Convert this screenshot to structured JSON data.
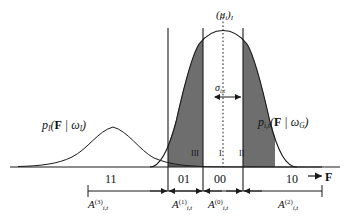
{
  "figure": {
    "axis": {
      "x_label": "F",
      "x_arrow": "→"
    },
    "curves": [
      {
        "name": "image-likelihood-curve",
        "label_html": "p_I(F | ω_I)",
        "label_main": "p",
        "label_sub": "I",
        "label_args_bf": "F",
        "label_bar": "|",
        "label_omega": "ω",
        "label_omega_sub": "I",
        "mean_x": 113,
        "peak_y": 118,
        "sigma": 45,
        "kind": "wide-gaussian"
      },
      {
        "name": "gaussian-mixture-curve",
        "label_main": "p",
        "label_sub": "i,t",
        "label_args_bf": "F",
        "label_bar": "|",
        "label_omega": "ω",
        "label_omega_sub": "G",
        "mean_x": 223,
        "peak_y": 40,
        "sigma": 17,
        "kind": "narrow-gaussian"
      }
    ],
    "mean_marker": {
      "name": "mean-dotted-line",
      "label_open": "(",
      "label_mu": "μ",
      "label_mu_sub": "i",
      "label_close": ")",
      "label_outer_sub": "I",
      "x": 223
    },
    "sigma_marker": {
      "name": "sigma-width-arrow",
      "label_sigma": "σ",
      "label_sub": "i,t",
      "left_x": 213,
      "right_x": 243,
      "y": 97
    },
    "vertical_lines": [
      {
        "name": "threshold-line-1",
        "x": 168
      },
      {
        "name": "threshold-line-2",
        "x": 203
      },
      {
        "name": "threshold-line-3",
        "x": 243
      }
    ],
    "regions": [
      {
        "name": "region-III",
        "label": "III",
        "shade": "dark"
      },
      {
        "name": "region-I",
        "label": "I",
        "shade": "light"
      },
      {
        "name": "region-II",
        "label": "II",
        "shade": "dark"
      }
    ],
    "code_labels": [
      {
        "name": "code-11",
        "label": "11"
      },
      {
        "name": "code-01",
        "label": "01"
      },
      {
        "name": "code-00",
        "label": "00"
      },
      {
        "name": "code-10",
        "label": "10"
      }
    ],
    "interval_labels": [
      {
        "name": "interval-A3",
        "base": "A",
        "sub": "i,t",
        "sup": "(3)"
      },
      {
        "name": "interval-A1",
        "base": "A",
        "sub": "i,t",
        "sup": "(1)"
      },
      {
        "name": "interval-A0",
        "base": "A",
        "sub": "i,t",
        "sup": "(0)"
      },
      {
        "name": "interval-A2",
        "base": "A",
        "sub": "i,t",
        "sup": "(2)"
      }
    ],
    "colors": {
      "stroke": "#1a1a1a",
      "shade_dark": "#6e6e6e",
      "shade_light": "#b9b9b9",
      "background": "#ffffff"
    }
  }
}
